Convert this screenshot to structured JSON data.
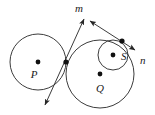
{
  "figure": {
    "background_color": "#ffffff",
    "stroke_color": "#262626",
    "label_color": "#1a1a1a",
    "width": 155,
    "height": 115
  },
  "labels": {
    "p": "P",
    "q": "Q",
    "s": "S",
    "m": "m",
    "n": "n"
  },
  "circles": [
    {
      "id": "circle-p",
      "label": "P",
      "cx": 38,
      "cy": 62,
      "r": 28
    },
    {
      "id": "circle-q",
      "label": "Q",
      "cx": 100,
      "cy": 74,
      "r": 34
    },
    {
      "id": "circle-s",
      "label": "S",
      "cx": 113,
      "cy": 55,
      "r": 15
    }
  ],
  "centers": [
    {
      "id": "center-p",
      "label": "P",
      "x": 38,
      "y": 62,
      "label_x": 36,
      "label_y": 76
    },
    {
      "id": "center-q",
      "label": "Q",
      "x": 100,
      "y": 74,
      "label_x": 98,
      "label_y": 90
    },
    {
      "id": "center-s",
      "label": "S",
      "x": 113,
      "y": 55,
      "label_x": 121,
      "label_y": 60
    }
  ],
  "tangent_points": [
    {
      "id": "tangency-pq",
      "x": 66,
      "y": 62,
      "between": "P and Q"
    },
    {
      "id": "tangency-qs",
      "x": 122,
      "y": 41,
      "between": "Q and S"
    }
  ],
  "lines": [
    {
      "id": "line-m",
      "label": "m",
      "label_x": 79,
      "label_y": 11,
      "x1": 84,
      "y1": 19,
      "x2": 45,
      "y2": 105,
      "arrow_start": true,
      "arrow_end": true,
      "description": "common tangent through tangency point of circles P and Q"
    },
    {
      "id": "line-n",
      "label": "n",
      "label_x": 141,
      "label_y": 62,
      "x1": 90,
      "y1": 21,
      "x2": 135,
      "y2": 50,
      "arrow_start": true,
      "arrow_end": true,
      "description": "common tangent through tangency point of circles Q and S"
    }
  ]
}
